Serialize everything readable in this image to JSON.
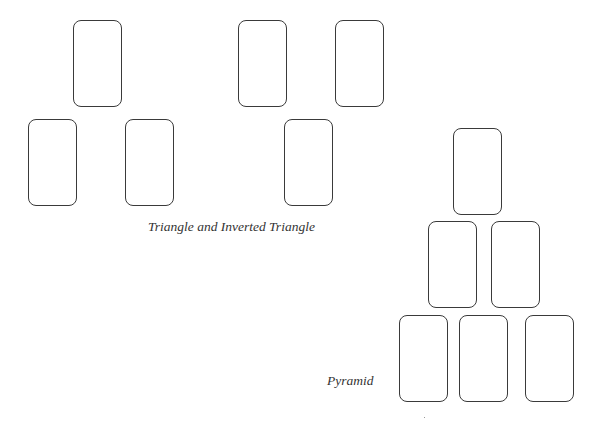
{
  "diagram": {
    "colors": {
      "card_border": "#3a3a3a",
      "background": "#ffffff",
      "text": "#333333"
    },
    "layouts": [
      {
        "name": "Triangle",
        "cards": [
          {
            "position": "top",
            "x": 73,
            "y": 20
          },
          {
            "position": "bottom-left",
            "x": 28,
            "y": 119
          },
          {
            "position": "bottom-right",
            "x": 125,
            "y": 119
          }
        ]
      },
      {
        "name": "Inverted Triangle",
        "cards": [
          {
            "position": "top-left",
            "x": 238,
            "y": 20
          },
          {
            "position": "top-right",
            "x": 335,
            "y": 20
          },
          {
            "position": "bottom",
            "x": 284,
            "y": 119
          }
        ]
      },
      {
        "name": "Pyramid",
        "cards": [
          {
            "position": "row1",
            "x": 453,
            "y": 128
          },
          {
            "position": "row2-left",
            "x": 428,
            "y": 221
          },
          {
            "position": "row2-right",
            "x": 491,
            "y": 221
          },
          {
            "position": "row3-left",
            "x": 399,
            "y": 315
          },
          {
            "position": "row3-middle",
            "x": 459,
            "y": 315
          },
          {
            "position": "row3-right",
            "x": 525,
            "y": 315
          }
        ]
      }
    ],
    "captions": {
      "triangles": "Triangle and Inverted Triangle",
      "pyramid": "Pyramid"
    }
  }
}
